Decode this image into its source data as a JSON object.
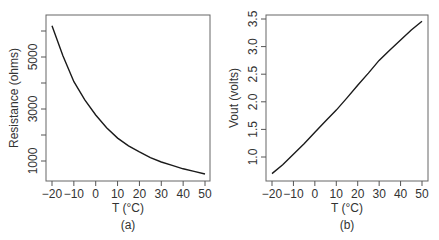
{
  "chart_data": [
    {
      "type": "line",
      "panel_label": "(a)",
      "title": "",
      "xlabel": "T (°C)",
      "ylabel": "Resistance (ohms)",
      "x": [
        -20,
        -15,
        -10,
        -5,
        0,
        5,
        10,
        15,
        20,
        25,
        30,
        35,
        40,
        45,
        50
      ],
      "series": [
        {
          "name": "Resistance",
          "values": [
            6200,
            5050,
            4050,
            3350,
            2770,
            2280,
            1880,
            1580,
            1350,
            1130,
            960,
            830,
            700,
            600,
            500
          ]
        }
      ],
      "xticks": [
        "-20",
        "-10",
        "0",
        "10",
        "20",
        "30",
        "40",
        "50"
      ],
      "yticks": [
        "1000",
        "3000",
        "5000"
      ],
      "yminor_ticks": [
        2000,
        4000,
        6000
      ],
      "xlim": [
        -20,
        50
      ],
      "ylim": [
        300,
        6500
      ],
      "grid": false,
      "legend": "none"
    },
    {
      "type": "line",
      "panel_label": "(b)",
      "title": "",
      "xlabel": "T (°C)",
      "ylabel": "Vout (volts)",
      "x": [
        -20,
        -15,
        -10,
        -5,
        0,
        5,
        10,
        15,
        20,
        25,
        30,
        35,
        40,
        45,
        50
      ],
      "series": [
        {
          "name": "Vout",
          "values": [
            0.7,
            0.86,
            1.05,
            1.24,
            1.45,
            1.65,
            1.85,
            2.07,
            2.3,
            2.52,
            2.75,
            2.94,
            3.12,
            3.3,
            3.46
          ]
        }
      ],
      "xticks": [
        "-20",
        "-10",
        "0",
        "10",
        "20",
        "30",
        "40",
        "50"
      ],
      "yticks": [
        "1.0",
        "1.5",
        "2.0",
        "2.5",
        "3.0",
        "3.5"
      ],
      "xlim": [
        -20,
        50
      ],
      "ylim": [
        0.6,
        3.55
      ],
      "grid": false,
      "legend": "none"
    }
  ],
  "colors": {
    "line": "#1a1a1a",
    "axis": "#555555",
    "text": "#333333"
  }
}
